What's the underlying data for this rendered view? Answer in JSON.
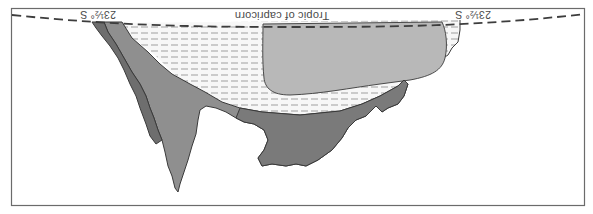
{
  "figure": {
    "orientation": "rotated-180",
    "labels": {
      "tropic_line": "Tropic of capricorn",
      "lat_left": "23½° S",
      "lat_right": "23½° S"
    },
    "colors": {
      "background": "#ffffff",
      "frame": "#6b6b6b",
      "tropic_dash": "#3d3d3d",
      "hatched_zone": "#f7f7f7",
      "hatch_dash": "#9a9a9a",
      "inner_zone": "#b8b8b8",
      "landmass_mid": "#8f8f8f",
      "landmass_dark": "#6e6e6e",
      "outline": "#3a3a3a"
    },
    "legend_regions": [
      {
        "name": "inner-zone",
        "fill": "light-grey"
      },
      {
        "name": "hatched-zone",
        "fill": "dashed-hatch"
      },
      {
        "name": "mid-grey-landmass",
        "fill": "mid-grey"
      },
      {
        "name": "dark-grey-landmass",
        "fill": "dark-grey"
      }
    ]
  }
}
